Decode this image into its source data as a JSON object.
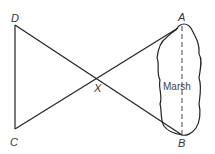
{
  "diagram": {
    "points": {
      "A": {
        "label": "A",
        "x": 182,
        "y": 27
      },
      "B": {
        "label": "B",
        "x": 182,
        "y": 135
      },
      "C": {
        "label": "C",
        "x": 15,
        "y": 129
      },
      "D": {
        "label": "D",
        "x": 15,
        "y": 25
      },
      "X": {
        "label": "X",
        "x": 98,
        "y": 79
      }
    },
    "region_label": "Marsh",
    "colors": {
      "line": "#222222",
      "background": "#ffffff"
    }
  }
}
